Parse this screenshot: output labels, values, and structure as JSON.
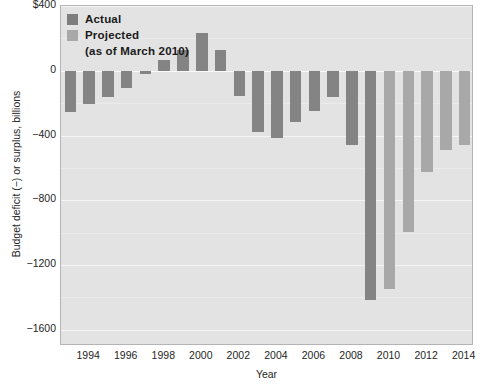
{
  "chart_data": {
    "type": "bar",
    "title": "",
    "xlabel": "Year",
    "ylabel": "Budget deficit (−) or surplus, billions",
    "ylim": [
      -1700,
      400
    ],
    "yticks": [
      400,
      0,
      -400,
      -800,
      -1200,
      -1600
    ],
    "ytick_labels": [
      "$400",
      "0",
      "−400",
      "−800",
      "−1200",
      "−1600"
    ],
    "xticks": [
      1994,
      1996,
      1998,
      2000,
      2002,
      2004,
      2006,
      2008,
      2010,
      2012,
      2014
    ],
    "xtick_labels": [
      "1994",
      "1996",
      "1998",
      "2000",
      "2002",
      "2004",
      "2006",
      "2008",
      "2010",
      "2012",
      "2014"
    ],
    "grid": true,
    "legend_position": "upper-left",
    "categories": [
      1993,
      1994,
      1995,
      1996,
      1997,
      1998,
      1999,
      2000,
      2001,
      2002,
      2003,
      2004,
      2005,
      2006,
      2007,
      2008,
      2009,
      2010,
      2011,
      2012,
      2013,
      2014
    ],
    "series": [
      {
        "name": "Actual",
        "color": "#848484",
        "values": [
          -255,
          -203,
          -164,
          -107,
          -22,
          69,
          126,
          236,
          128,
          -158,
          -378,
          -413,
          -318,
          -248,
          -161,
          -459,
          -1413,
          null,
          null,
          null,
          null,
          null
        ]
      },
      {
        "name": "Projected (as of March 2010)",
        "color": "#a8a8a8",
        "values": [
          null,
          null,
          null,
          null,
          null,
          null,
          null,
          null,
          null,
          null,
          null,
          null,
          null,
          null,
          null,
          null,
          null,
          -1350,
          -996,
          -628,
          -490,
          -456
        ]
      }
    ]
  },
  "legend": {
    "entries": [
      {
        "label": "Actual",
        "swatch": "actual"
      },
      {
        "label": "Projected",
        "swatch": "projected"
      }
    ],
    "sublabel": "(as of March 2010)"
  }
}
